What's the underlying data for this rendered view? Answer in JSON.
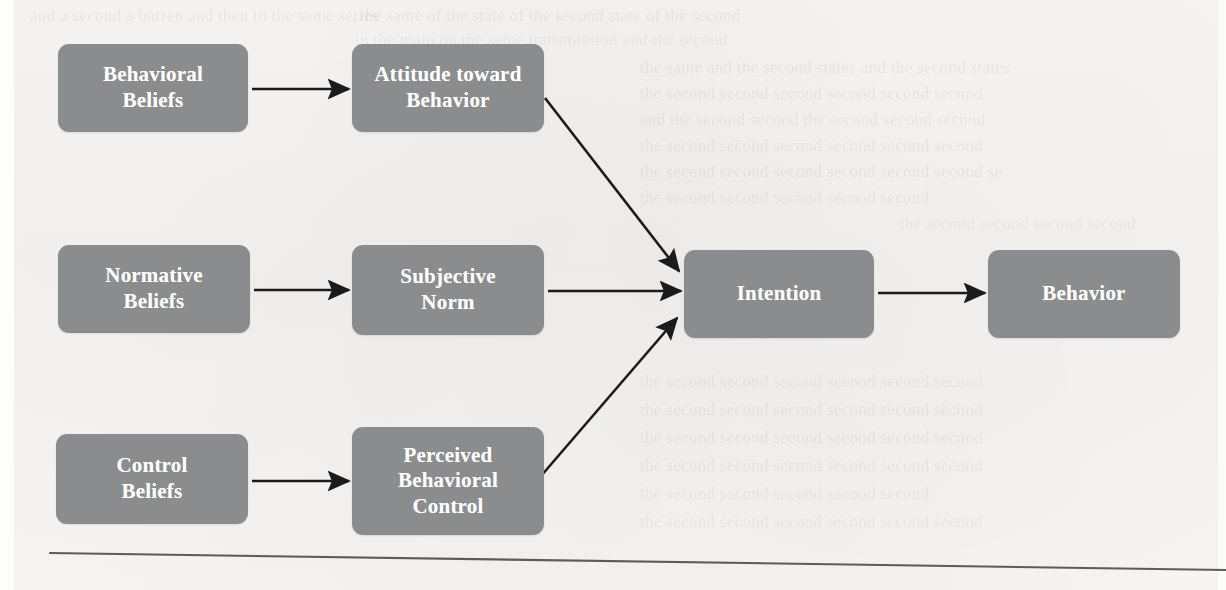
{
  "figure": {
    "kind": "flow-diagram",
    "title_visible": false,
    "background_color": "#f6f5f3",
    "node_fill_color": "#8a8c8e",
    "node_text_color": "#ffffff",
    "arrow_color": "#1b1b1b",
    "rule_color": "#5b5b5b"
  },
  "nodes": [
    {
      "id": "behavioral-beliefs",
      "label": "Behavioral\nBeliefs",
      "line1": "Behavioral",
      "line2": "Beliefs",
      "x": 58,
      "y": 44,
      "w": 190,
      "h": 88
    },
    {
      "id": "attitude-toward-behavior",
      "label": "Attitude toward\nBehavior",
      "line1": "Attitude toward",
      "line2": "Behavior",
      "x": 352,
      "y": 44,
      "w": 192,
      "h": 88
    },
    {
      "id": "normative-beliefs",
      "label": "Normative\nBeliefs",
      "line1": "Normative",
      "line2": "Beliefs",
      "x": 58,
      "y": 245,
      "w": 192,
      "h": 88
    },
    {
      "id": "subjective-norm",
      "label": "Subjective\nNorm",
      "line1": "Subjective",
      "line2": "Norm",
      "x": 352,
      "y": 245,
      "w": 192,
      "h": 90
    },
    {
      "id": "control-beliefs",
      "label": "Control\nBeliefs",
      "line1": "Control",
      "line2": "Beliefs",
      "x": 56,
      "y": 434,
      "w": 192,
      "h": 90
    },
    {
      "id": "perceived-behavioral-control",
      "label": "Perceived\nBehavioral\nControl",
      "line1": "Perceived",
      "line2": "Behavioral",
      "line3": "Control",
      "x": 352,
      "y": 427,
      "w": 192,
      "h": 108
    },
    {
      "id": "intention",
      "label": "Intention",
      "line1": "Intention",
      "x": 684,
      "y": 250,
      "w": 190,
      "h": 88
    },
    {
      "id": "behavior",
      "label": "Behavior",
      "line1": "Behavior",
      "x": 988,
      "y": 250,
      "w": 192,
      "h": 88
    }
  ],
  "edges": [
    {
      "id": "edge-behavioral-beliefs-to-attitude",
      "from": "Behavioral Beliefs",
      "to": "Attitude toward Behavior",
      "kind": "straight-horizontal"
    },
    {
      "id": "edge-normative-beliefs-to-subjective-norm",
      "from": "Normative Beliefs",
      "to": "Subjective Norm",
      "kind": "straight-horizontal"
    },
    {
      "id": "edge-control-beliefs-to-perceived-control",
      "from": "Control Beliefs",
      "to": "Perceived Behavioral Control",
      "kind": "straight-horizontal"
    },
    {
      "id": "edge-attitude-to-intention",
      "from": "Attitude toward Behavior",
      "to": "Intention",
      "kind": "diagonal-down"
    },
    {
      "id": "edge-subjective-norm-to-intention",
      "from": "Subjective Norm",
      "to": "Intention",
      "kind": "straight-horizontal"
    },
    {
      "id": "edge-perceived-control-to-intention",
      "from": "Perceived Behavioral Control",
      "to": "Intention",
      "kind": "diagonal-up"
    },
    {
      "id": "edge-intention-to-behavior",
      "from": "Intention",
      "to": "Behavior",
      "kind": "straight-horizontal"
    }
  ],
  "footer_rule": {
    "id": "footer-rule",
    "x1": 50,
    "y1": 553,
    "x2": 1226,
    "y2": 570
  },
  "background_ghost_text": [
    {
      "text": "and a second a barren and then in the same series",
      "x": 30,
      "y": 6,
      "size": 17,
      "opacity": 0.05
    },
    {
      "text": "the same of the state of the second state of the second",
      "x": 360,
      "y": 6,
      "size": 17,
      "opacity": 0.05
    },
    {
      "text": "in the main on the same transmission and the second",
      "x": 355,
      "y": 30,
      "size": 17,
      "opacity": 0.045
    },
    {
      "text": "the same and the second states and the second states",
      "x": 640,
      "y": 58,
      "size": 17,
      "opacity": 0.05
    },
    {
      "text": "the second second second second second second",
      "x": 640,
      "y": 84,
      "size": 17,
      "opacity": 0.05
    },
    {
      "text": "and the second second the second second second",
      "x": 640,
      "y": 110,
      "size": 17,
      "opacity": 0.048
    },
    {
      "text": "the second second second second second second",
      "x": 640,
      "y": 136,
      "size": 17,
      "opacity": 0.046
    },
    {
      "text": "the second second second second second second se",
      "x": 640,
      "y": 162,
      "size": 17,
      "opacity": 0.05
    },
    {
      "text": "the second second second second second",
      "x": 640,
      "y": 188,
      "size": 17,
      "opacity": 0.045
    },
    {
      "text": "the second second second second",
      "x": 900,
      "y": 214,
      "size": 17,
      "opacity": 0.04
    },
    {
      "text": "the second second second second second second",
      "x": 640,
      "y": 372,
      "size": 17,
      "opacity": 0.045
    },
    {
      "text": "the second second second second second second",
      "x": 640,
      "y": 400,
      "size": 17,
      "opacity": 0.05
    },
    {
      "text": "the second second second second second second",
      "x": 640,
      "y": 428,
      "size": 17,
      "opacity": 0.05
    },
    {
      "text": "the second second second second second second",
      "x": 640,
      "y": 456,
      "size": 17,
      "opacity": 0.048
    },
    {
      "text": "the second second second second second",
      "x": 640,
      "y": 484,
      "size": 17,
      "opacity": 0.044
    },
    {
      "text": "the second second second second second second",
      "x": 640,
      "y": 512,
      "size": 17,
      "opacity": 0.042
    }
  ]
}
